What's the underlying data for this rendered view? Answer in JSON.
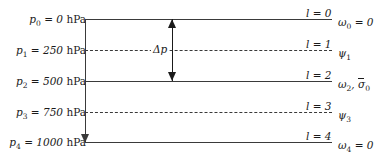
{
  "figure": {
    "levels": [
      {
        "index": "0",
        "pressure_label": "p₀ = 0 hPa",
        "pressure_value": 0,
        "pressure_unit": "hPa",
        "level_label": "l = 0",
        "variable_label": "ω₀ = 0",
        "line_style": "solid",
        "y": 19
      },
      {
        "index": "1",
        "pressure_label": "p₁ = 250 hPa",
        "pressure_value": 250,
        "pressure_unit": "hPa",
        "level_label": "l = 1",
        "variable_label": "ψ₁",
        "line_style": "dashed",
        "y": 50
      },
      {
        "index": "2",
        "pressure_label": "p₂ = 500 hPa",
        "pressure_value": 500,
        "pressure_unit": "hPa",
        "level_label": "l = 2",
        "variable_label": "ω₂, σ̄₀",
        "line_style": "solid",
        "y": 81
      },
      {
        "index": "3",
        "pressure_label": "p₃ = 750 hPa",
        "pressure_value": 750,
        "pressure_unit": "hPa",
        "level_label": "l = 3",
        "variable_label": "ψ₃",
        "line_style": "dashed",
        "y": 112
      },
      {
        "index": "4",
        "pressure_label": "p₄ = 1000 hPa",
        "pressure_value": 1000,
        "pressure_unit": "hPa",
        "level_label": "l = 4",
        "variable_label": "ω₄ = 0",
        "line_style": "solid",
        "y": 142
      }
    ],
    "annotation": {
      "delta_p_label": "Δp",
      "delta_p_value": 500,
      "delta_p_unit": "hPa",
      "spans_from_level": "0",
      "spans_to_level": "2"
    },
    "axis": {
      "direction": "downward",
      "quantity": "p"
    },
    "colors": {
      "line": "#3a3a3a",
      "text": "#1a1a1a",
      "background": "#ffffff"
    }
  }
}
